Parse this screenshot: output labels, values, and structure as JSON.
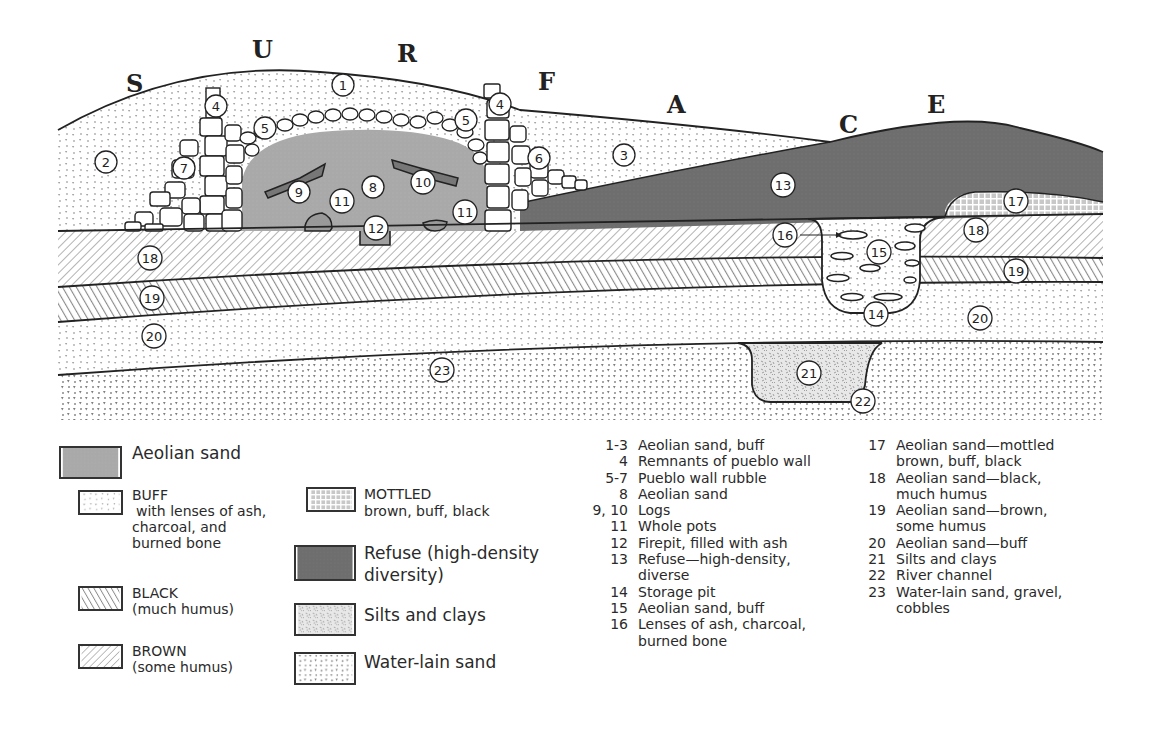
{
  "figure": {
    "surface_letters": [
      "S",
      "U",
      "R",
      "F",
      "A",
      "C",
      "E"
    ],
    "layer_numbers": [
      "1",
      "2",
      "3",
      "4",
      "4",
      "5",
      "5",
      "6",
      "7",
      "8",
      "9",
      "10",
      "11",
      "11",
      "12",
      "13",
      "14",
      "15",
      "16",
      "17",
      "18",
      "18",
      "19",
      "19",
      "20",
      "20",
      "21",
      "22",
      "23"
    ]
  },
  "legend": {
    "aeolian_sand": {
      "label": "Aeolian sand",
      "color": "#a8a8a8"
    },
    "buff": {
      "title": "BUFF",
      "desc": "with lenses of ash,",
      "desc2": "charcoal, and",
      "desc3": "burned bone"
    },
    "black": {
      "title": "BLACK",
      "desc": "(much humus)"
    },
    "brown": {
      "title": "BROWN",
      "desc": "(some humus)"
    },
    "mottled": {
      "title": "MOTTLED",
      "desc": "brown, buff, black"
    },
    "refuse": {
      "label": "Refuse (high-density",
      "label2": "diversity)",
      "color": "#6f6f6f"
    },
    "silts": {
      "label": "Silts and clays"
    },
    "water_lain": {
      "label": "Water-lain sand"
    }
  },
  "key": {
    "column1": [
      {
        "num": "1-3",
        "desc": "Aeolian sand, buff"
      },
      {
        "num": "4",
        "desc": "Remnants of pueblo wall"
      },
      {
        "num": "5-7",
        "desc": "Pueblo wall rubble"
      },
      {
        "num": "8",
        "desc": "Aeolian sand"
      },
      {
        "num": "9, 10",
        "desc": "Logs"
      },
      {
        "num": "11",
        "desc": "Whole pots"
      },
      {
        "num": "12",
        "desc": "Firepit, filled with ash"
      },
      {
        "num": "13",
        "desc": "Refuse—high-density,\ndiverse"
      },
      {
        "num": "14",
        "desc": "Storage pit"
      },
      {
        "num": "15",
        "desc": "Aeolian sand, buff"
      },
      {
        "num": "16",
        "desc": "Lenses of ash, charcoal,\nburned bone"
      }
    ],
    "column2": [
      {
        "num": "17",
        "desc": "Aeolian sand—mottled\nbrown, buff, black"
      },
      {
        "num": "18",
        "desc": "Aeolian sand—black,\nmuch humus"
      },
      {
        "num": "19",
        "desc": "Aeolian sand—brown,\nsome humus"
      },
      {
        "num": "20",
        "desc": "Aeolian sand—buff"
      },
      {
        "num": "21",
        "desc": "Silts and clays"
      },
      {
        "num": "22",
        "desc": "River channel"
      },
      {
        "num": "23",
        "desc": "Water-lain sand, gravel,\ncobbles"
      }
    ]
  }
}
